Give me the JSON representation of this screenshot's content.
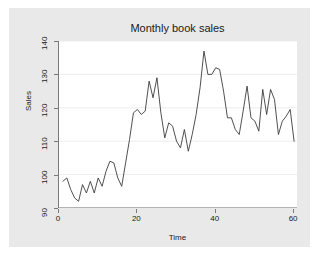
{
  "chart_data": {
    "type": "line",
    "title": "Monthly book sales",
    "xlabel": "Time",
    "ylabel": "Sales",
    "xlim": [
      0,
      61
    ],
    "ylim": [
      90,
      140
    ],
    "xticks": [
      0,
      20,
      40,
      60
    ],
    "yticks": [
      90,
      100,
      110,
      120,
      130,
      140
    ],
    "grid": "horizontal",
    "legend": "none",
    "line_color": "#3c3c3c",
    "plot_background": "#ffffff",
    "graph_background": "#e9e9e9",
    "series": [
      {
        "name": "Sales",
        "x": [
          1,
          2,
          3,
          4,
          5,
          6,
          7,
          8,
          9,
          10,
          11,
          12,
          13,
          14,
          15,
          16,
          17,
          18,
          19,
          20,
          21,
          22,
          23,
          24,
          25,
          26,
          27,
          28,
          29,
          30,
          31,
          32,
          33,
          34,
          35,
          36,
          37,
          38,
          39,
          40,
          41,
          42,
          43,
          44,
          45,
          46,
          47,
          48,
          49,
          50,
          51,
          52,
          53,
          54,
          55,
          56,
          57,
          58,
          59,
          60
        ],
        "values": [
          98.0,
          99.0,
          95.5,
          93.0,
          92.0,
          97.0,
          94.5,
          98.0,
          94.5,
          99.0,
          96.5,
          101.0,
          104.0,
          103.5,
          99.0,
          96.5,
          103.5,
          110.5,
          118.5,
          119.5,
          118.0,
          119.0,
          128.0,
          123.0,
          129.0,
          118.5,
          111.0,
          115.5,
          114.5,
          110.0,
          108.0,
          113.5,
          107.0,
          112.0,
          118.0,
          126.0,
          137.0,
          130.0,
          130.0,
          132.0,
          131.5,
          125.0,
          117.0,
          117.0,
          113.5,
          112.0,
          119.0,
          126.5,
          117.0,
          116.0,
          113.0,
          125.5,
          118.0,
          125.5,
          122.5,
          112.0,
          116.0,
          117.5,
          119.5,
          110.0
        ]
      }
    ]
  },
  "axes": {
    "y_tick_labels": [
      "90",
      "100",
      "110",
      "120",
      "130",
      "140"
    ],
    "x_tick_labels": [
      "0",
      "20",
      "40",
      "60"
    ]
  }
}
